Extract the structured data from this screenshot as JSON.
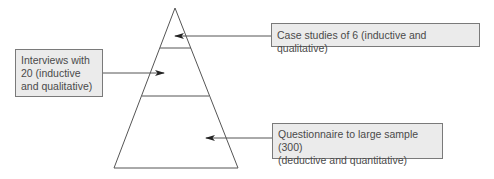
{
  "diagram": {
    "type": "pyramid",
    "levels": [
      {
        "name": "top",
        "label": "Case studies of 6  (inductive and qualitative)"
      },
      {
        "name": "middle",
        "label_lines": [
          "Interviews with",
          "20 (inductive",
          "and qualitative)"
        ]
      },
      {
        "name": "bottom",
        "label_lines": [
          "Questionnaire to large sample (300)",
          "(deductive and quantitative)"
        ]
      }
    ]
  },
  "colors": {
    "box_fill": "#ebebeb",
    "box_border": "#7a7a7a",
    "line": "#555555",
    "text": "#4a4a4a"
  }
}
